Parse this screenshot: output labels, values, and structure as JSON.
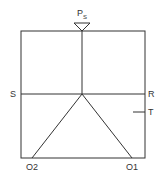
{
  "diagram": {
    "source_label": "P",
    "source_subscript": "S",
    "labels": {
      "S": "S",
      "R": "R",
      "T": "T",
      "O1": "O1",
      "O2": "O2"
    },
    "colors": {
      "line": "#333333",
      "background": "#ffffff"
    }
  }
}
